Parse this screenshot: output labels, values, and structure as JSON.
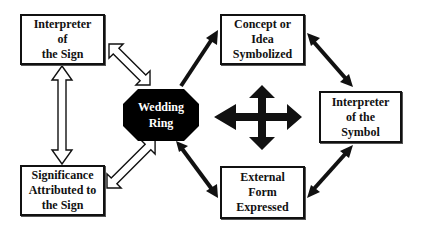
{
  "diagram": {
    "center": {
      "shape": "octagon",
      "lines": [
        "Wedding",
        "Ring"
      ],
      "fill": "#000000",
      "text_color": "#ffffff"
    },
    "nodes": {
      "interpreter_sign": {
        "lines": [
          "Interpreter",
          "of",
          "the Sign"
        ]
      },
      "significance": {
        "lines": [
          "Significance",
          "Attributed to",
          "the Sign"
        ]
      },
      "concept": {
        "lines": [
          "Concept or",
          "Idea",
          "Symbolized"
        ]
      },
      "external_form": {
        "lines": [
          "External",
          "Form",
          "Expressed"
        ]
      },
      "interpreter_symbol": {
        "lines": [
          "Interpreter",
          "of the",
          "Symbol"
        ]
      }
    },
    "connectors": [
      {
        "from": "interpreter_sign",
        "to": "wedding_ring",
        "style": "hollow-double-arrow"
      },
      {
        "from": "significance",
        "to": "wedding_ring",
        "style": "hollow-double-arrow"
      },
      {
        "from": "interpreter_sign",
        "to": "significance",
        "style": "hollow-double-arrow"
      },
      {
        "from": "wedding_ring",
        "to": "concept",
        "style": "solid-arrow"
      },
      {
        "from": "wedding_ring",
        "to": "external_form",
        "style": "solid-arrow"
      },
      {
        "from": "concept",
        "to": "interpreter_symbol",
        "style": "solid-double-arrow"
      },
      {
        "from": "external_form",
        "to": "interpreter_symbol",
        "style": "solid-double-arrow"
      }
    ],
    "center_symbol": "four-way-arrow",
    "colors": {
      "stroke": "#111111",
      "background": "#ffffff"
    }
  }
}
